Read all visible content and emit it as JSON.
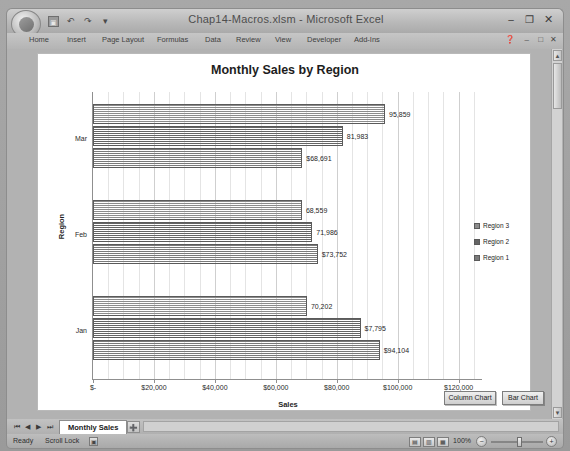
{
  "window": {
    "title": "Chap14-Macros.xlsm - Microsoft Excel",
    "orb_label": "",
    "minimize": "–",
    "restore": "❐",
    "close": "✕"
  },
  "quick_access": {
    "save": "▣",
    "undo": "↶",
    "redo": "↷",
    "customize": "▾"
  },
  "ribbon": {
    "tabs": [
      {
        "label": "Home",
        "left": 22
      },
      {
        "label": "Insert",
        "left": 60
      },
      {
        "label": "Page Layout",
        "left": 95
      },
      {
        "label": "Formulas",
        "left": 150
      },
      {
        "label": "Data",
        "left": 198
      },
      {
        "label": "Review",
        "left": 229
      },
      {
        "label": "View",
        "left": 268
      },
      {
        "label": "Developer",
        "left": 300
      },
      {
        "label": "Add-Ins",
        "left": 347
      }
    ],
    "help_icon": "❓",
    "minimize_ribbon": "–",
    "restore_window": "□",
    "close_window": "✕"
  },
  "scrollbar": {
    "up_arrow": "▲",
    "down_arrow": "▼"
  },
  "chart_data": {
    "type": "bar",
    "title": "Monthly Sales by Region",
    "xlabel": "Sales",
    "ylabel": "Region",
    "orientation": "horizontal",
    "xlim": [
      0,
      128000
    ],
    "grid": true,
    "legend_position": "right",
    "categories": [
      "Jan",
      "Feb",
      "Mar"
    ],
    "x_tick_values": [
      0,
      20000,
      40000,
      60000,
      80000,
      100000,
      120000
    ],
    "x_tick_labels": [
      "$-",
      "$20,000",
      "$40,000",
      "$60,000",
      "$80,000",
      "$100,000",
      "$120,000"
    ],
    "series": [
      {
        "name": "Region 1",
        "color": "#7a7a7a",
        "values": [
          94104,
          73752,
          68691
        ],
        "labels": [
          "$94,104",
          "$73,752",
          "$68,691"
        ]
      },
      {
        "name": "Region 2",
        "color": "#646464",
        "values": [
          87795,
          71986,
          81983
        ],
        "labels": [
          "$7,795",
          "71,986",
          "81,983"
        ]
      },
      {
        "name": "Region 3",
        "color": "#8c8c8c",
        "values": [
          70202,
          68559,
          95859
        ],
        "labels": [
          "70,202",
          "68,559",
          "95,859"
        ]
      }
    ],
    "legend_entries": [
      "Region 3",
      "Region 2",
      "Region 1"
    ]
  },
  "form_controls": {
    "column_chart_button": "Column Chart",
    "bar_chart_button": "Bar Chart"
  },
  "sheet_tabs": {
    "nav_first": "⏮",
    "nav_prev": "◀",
    "nav_next": "▶",
    "nav_last": "⏭",
    "active_sheet": "Monthly Sales",
    "insert_sheet": "➕"
  },
  "status_bar": {
    "ready": "Ready",
    "scroll_lock": "Scroll Lock",
    "macro_record_icon": "▣",
    "view_normal_icon": "▤",
    "view_page_layout_icon": "▥",
    "view_page_break_icon": "▦",
    "zoom_level": "100%",
    "zoom_out": "−",
    "zoom_in": "+"
  }
}
